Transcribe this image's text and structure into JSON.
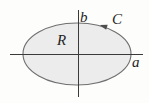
{
  "figure": {
    "labels": {
      "region": "R",
      "curve": "C",
      "x_intercept": "a",
      "y_intercept": "b"
    },
    "orientation": "counterclockwise",
    "colors": {
      "ellipse_fill": "#ececec",
      "ellipse_stroke": "#6f6f6f",
      "axis_stroke": "#3a3a3a",
      "arrow_fill": "#4d4d4d",
      "label_color": "#1f1f1f",
      "background": "#fdfdfc"
    }
  }
}
